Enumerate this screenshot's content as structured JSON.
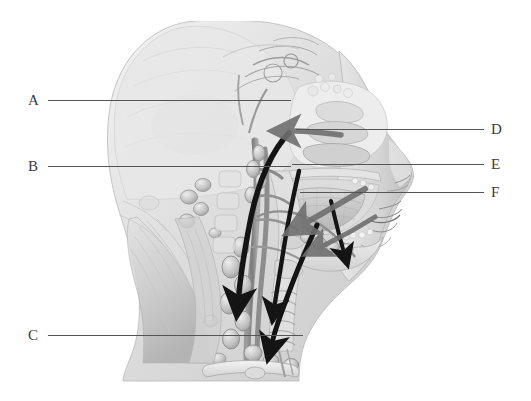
{
  "figure": {
    "style": "grayscale medical illustration",
    "background_color": "#ffffff",
    "line_color": "#555555",
    "letter_color": "#3b3b3b",
    "arrow_color_dark": "#1a1a1a",
    "arrow_color_gray": "#6f6f6f"
  },
  "labels": [
    {
      "id": "A",
      "letter": "A",
      "side": "left",
      "letter_x": 28,
      "letter_y": 93,
      "line_x": 48,
      "line_y": 100,
      "line_width": 243
    },
    {
      "id": "B",
      "letter": "B",
      "side": "left",
      "letter_x": 28,
      "letter_y": 159,
      "line_x": 48,
      "line_y": 166,
      "line_width": 243
    },
    {
      "id": "C",
      "letter": "C",
      "side": "left",
      "letter_x": 28,
      "letter_y": 328,
      "line_x": 48,
      "line_y": 335,
      "line_width": 255
    },
    {
      "id": "D",
      "letter": "D",
      "side": "right",
      "letter_x": 491,
      "letter_y": 122,
      "line_x": 296,
      "line_y": 129,
      "line_width": 188
    },
    {
      "id": "E",
      "letter": "E",
      "side": "right",
      "letter_x": 491,
      "letter_y": 157,
      "line_x": 292,
      "line_y": 164,
      "line_width": 192
    },
    {
      "id": "F",
      "letter": "F",
      "side": "right",
      "letter_x": 491,
      "letter_y": 185,
      "line_x": 300,
      "line_y": 192,
      "line_width": 184
    }
  ],
  "illustration": {
    "regions": [
      "cranium",
      "frontal-sinus",
      "nasal-cavity",
      "nasal-turbinates",
      "external-nose",
      "upper-lip",
      "oral-cavity",
      "tongue",
      "hard-palate",
      "soft-palate",
      "mandible",
      "teeth",
      "pharynx",
      "larynx",
      "trachea",
      "cervical-vertebrae",
      "occipital-region",
      "sternocleidomastoid",
      "trapezius",
      "clavicle",
      "thyroid-gland"
    ],
    "vessels": [
      "internal-carotid-artery",
      "external-carotid-artery",
      "internal-jugular-vein",
      "facial-artery",
      "lingual-artery",
      "superficial-temporal-artery"
    ],
    "lymphatic_structures": [
      "deep-cervical-lymph-nodes",
      "superficial-cervical-lymph-nodes",
      "submandibular-lymph-nodes",
      "submental-lymph-nodes",
      "retropharyngeal-lymph-nodes",
      "jugulodigastric-node",
      "supraclavicular-lymph-nodes",
      "thoracic-duct"
    ],
    "flow_arrows": [
      {
        "name": "deep-cervical-descending-flow",
        "color": "#141414",
        "direction": "inferior"
      },
      {
        "name": "jugular-chain-flow",
        "color": "#141414",
        "direction": "infero-anterior"
      },
      {
        "name": "anterior-cervical-flow",
        "color": "#141414",
        "direction": "inferior"
      },
      {
        "name": "submandibular-to-cervical-flow",
        "color": "#141414",
        "direction": "infero-posterior"
      },
      {
        "name": "oral-cavity-drainage",
        "color": "#6f6f6f",
        "direction": "postero-inferior"
      },
      {
        "name": "tongue-drainage",
        "color": "#6f6f6f",
        "direction": "postero-inferior"
      },
      {
        "name": "nasopharynx-drainage",
        "color": "#6f6f6f",
        "direction": "posterior"
      }
    ]
  }
}
